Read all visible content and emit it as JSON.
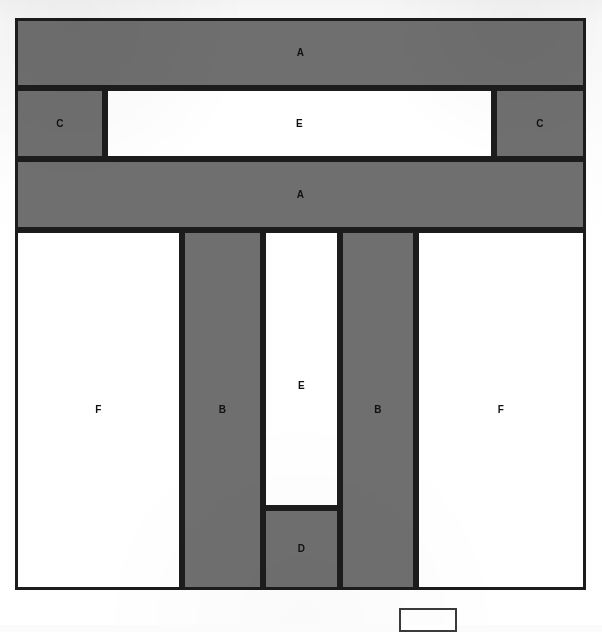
{
  "diagram": {
    "type": "schematic-block-layout",
    "colors": {
      "fill_gray": "#6f6f6f",
      "fill_white": "#ffffff",
      "stroke": "#1c1c1c",
      "page_background": "#ffffff"
    },
    "frame": {
      "x": 15,
      "y": 18,
      "width": 571,
      "height": 572
    },
    "rows": [
      {
        "row_id": "row-1",
        "cells": [
          {
            "id": "cell-a-top",
            "label": "A",
            "fill": "gray",
            "x": 15,
            "y": 18,
            "width": 571,
            "height": 70
          }
        ]
      },
      {
        "row_id": "row-2",
        "cells": [
          {
            "id": "cell-c-left",
            "label": "C",
            "fill": "gray",
            "x": 15,
            "y": 88,
            "width": 90,
            "height": 71
          },
          {
            "id": "cell-e-top",
            "label": "E",
            "fill": "white",
            "x": 105,
            "y": 88,
            "width": 389,
            "height": 71
          },
          {
            "id": "cell-c-right",
            "label": "C",
            "fill": "gray",
            "x": 494,
            "y": 88,
            "width": 92,
            "height": 71
          }
        ]
      },
      {
        "row_id": "row-3",
        "cells": [
          {
            "id": "cell-a-middle",
            "label": "A",
            "fill": "gray",
            "x": 15,
            "y": 159,
            "width": 571,
            "height": 71
          }
        ]
      },
      {
        "row_id": "row-4",
        "cells": [
          {
            "id": "cell-f-left",
            "label": "F",
            "fill": "white",
            "x": 15,
            "y": 230,
            "width": 167,
            "height": 360
          },
          {
            "id": "cell-b-left",
            "label": "B",
            "fill": "gray",
            "x": 182,
            "y": 230,
            "width": 81,
            "height": 360
          },
          {
            "id": "cell-e-bottom",
            "label": "E",
            "fill": "white",
            "x": 263,
            "y": 230,
            "width": 77,
            "height": 278
          },
          {
            "id": "cell-d",
            "label": "D",
            "fill": "gray",
            "x": 263,
            "y": 508,
            "width": 77,
            "height": 82
          },
          {
            "id": "cell-b-right",
            "label": "B",
            "fill": "gray",
            "x": 340,
            "y": 230,
            "width": 76,
            "height": 360
          },
          {
            "id": "cell-f-right",
            "label": "F",
            "fill": "white",
            "x": 416,
            "y": 230,
            "width": 170,
            "height": 360
          }
        ]
      }
    ],
    "legend_swatch": {
      "id": "legend-swatch",
      "label": "",
      "fill": "white",
      "x": 399,
      "y": 608,
      "width": 58,
      "height": 24,
      "note_clipped_by_page_edge": true
    }
  }
}
